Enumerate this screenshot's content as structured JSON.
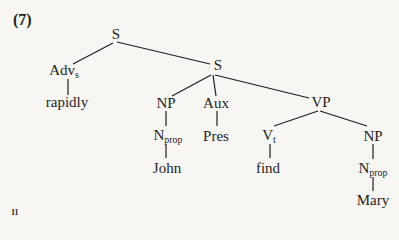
{
  "example_number": "(7)",
  "page_number": "11",
  "tree": {
    "nodes": {
      "s_top": {
        "label": "S"
      },
      "advs": {
        "label": "Adv",
        "sub": "s"
      },
      "rapidly": {
        "label": "rapidly"
      },
      "s_inner": {
        "label": "S"
      },
      "np_subj": {
        "label": "NP"
      },
      "nprop_subj": {
        "label": "N",
        "sub": "prop"
      },
      "john": {
        "label": "John"
      },
      "aux": {
        "label": "Aux"
      },
      "pres": {
        "label": "Pres"
      },
      "vp": {
        "label": "VP"
      },
      "vt": {
        "label": "V",
        "sub": "t"
      },
      "find": {
        "label": "find"
      },
      "np_obj": {
        "label": "NP"
      },
      "nprop_obj": {
        "label": "N",
        "sub": "prop"
      },
      "mary": {
        "label": "Mary"
      }
    },
    "edges": [
      [
        "s_top",
        "advs"
      ],
      [
        "s_top",
        "s_inner"
      ],
      [
        "advs",
        "rapidly"
      ],
      [
        "s_inner",
        "np_subj"
      ],
      [
        "s_inner",
        "aux"
      ],
      [
        "s_inner",
        "vp"
      ],
      [
        "np_subj",
        "nprop_subj"
      ],
      [
        "nprop_subj",
        "john"
      ],
      [
        "aux",
        "pres"
      ],
      [
        "vp",
        "vt"
      ],
      [
        "vp",
        "np_obj"
      ],
      [
        "vt",
        "find"
      ],
      [
        "np_obj",
        "nprop_obj"
      ],
      [
        "nprop_obj",
        "mary"
      ]
    ]
  }
}
